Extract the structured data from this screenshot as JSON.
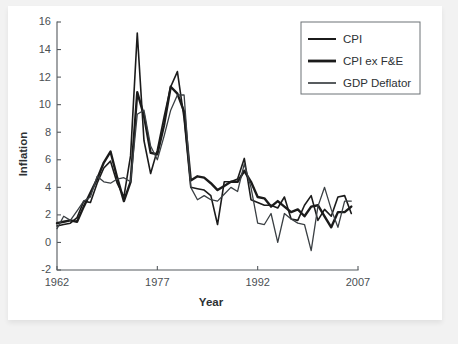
{
  "chart_data": {
    "type": "line",
    "title": "",
    "xlabel": "Year",
    "ylabel": "Inflation",
    "xlim": [
      1962,
      2007
    ],
    "ylim": [
      -2,
      16
    ],
    "xticks": [
      1962,
      1977,
      1992,
      2007
    ],
    "yticks": [
      -2,
      0,
      2,
      4,
      6,
      8,
      10,
      12,
      14,
      16
    ],
    "xtick_labels": [
      "1962",
      "1977",
      "1992",
      "2007"
    ],
    "ytick_labels": [
      "-2",
      "0",
      "2",
      "4",
      "6",
      "8",
      "10",
      "12",
      "14",
      "16"
    ],
    "grid": false,
    "legend_position": "upper right",
    "x": [
      1962,
      1963,
      1964,
      1965,
      1966,
      1967,
      1968,
      1969,
      1970,
      1971,
      1972,
      1973,
      1974,
      1975,
      1976,
      1977,
      1978,
      1979,
      1980,
      1981,
      1982,
      1983,
      1984,
      1985,
      1986,
      1987,
      1988,
      1989,
      1990,
      1991,
      1992,
      1993,
      1994,
      1995,
      1996,
      1997,
      1998,
      1999,
      2000,
      2001,
      2002,
      2003,
      2004,
      2005,
      2006
    ],
    "series": [
      {
        "name": "CPI",
        "color": "#1b1b1b",
        "width": 1.6,
        "values": [
          1.2,
          1.3,
          1.4,
          1.8,
          3.0,
          2.9,
          4.3,
          5.4,
          5.9,
          4.3,
          3.3,
          6.3,
          15.2,
          7.4,
          5.0,
          6.7,
          9.1,
          11.3,
          12.4,
          9.0,
          4.0,
          3.9,
          3.8,
          3.4,
          1.3,
          4.4,
          4.4,
          4.6,
          6.1,
          3.1,
          2.9,
          2.7,
          2.7,
          2.5,
          3.3,
          1.7,
          1.6,
          2.7,
          3.4,
          1.6,
          2.4,
          1.9,
          3.3,
          3.4,
          2.1
        ]
      },
      {
        "name": "CPI ex F&E",
        "color": "#1b1b1b",
        "width": 2.4,
        "values": [
          1.4,
          1.5,
          1.6,
          1.5,
          2.6,
          3.6,
          4.6,
          5.8,
          6.6,
          4.7,
          3.0,
          4.4,
          10.9,
          9.2,
          6.5,
          6.4,
          8.5,
          11.3,
          10.8,
          9.5,
          4.5,
          4.8,
          4.7,
          4.3,
          3.8,
          4.1,
          4.4,
          4.4,
          5.2,
          4.4,
          3.3,
          3.2,
          2.6,
          3.0,
          2.6,
          2.2,
          2.4,
          1.9,
          2.6,
          2.7,
          1.9,
          1.1,
          2.2,
          2.2,
          2.6
        ]
      },
      {
        "name": "GDP Deflator",
        "color": "#3a3f43",
        "width": 1.3,
        "values": [
          1.0,
          1.9,
          1.6,
          2.3,
          3.0,
          3.3,
          4.8,
          4.4,
          4.3,
          4.6,
          4.7,
          4.4,
          9.3,
          9.6,
          7.0,
          6.0,
          7.7,
          9.6,
          10.7,
          10.7,
          4.0,
          3.1,
          3.4,
          3.1,
          3.0,
          3.5,
          4.0,
          3.7,
          5.7,
          4.0,
          1.4,
          1.3,
          2.1,
          0.0,
          2.1,
          1.7,
          1.4,
          1.3,
          -0.6,
          2.6,
          4.0,
          2.4,
          1.1,
          3.0,
          3.0
        ]
      }
    ]
  },
  "legend": {
    "entries": [
      {
        "label": "CPI"
      },
      {
        "label": "CPI ex F&E"
      },
      {
        "label": "GDP Deflator"
      }
    ]
  }
}
